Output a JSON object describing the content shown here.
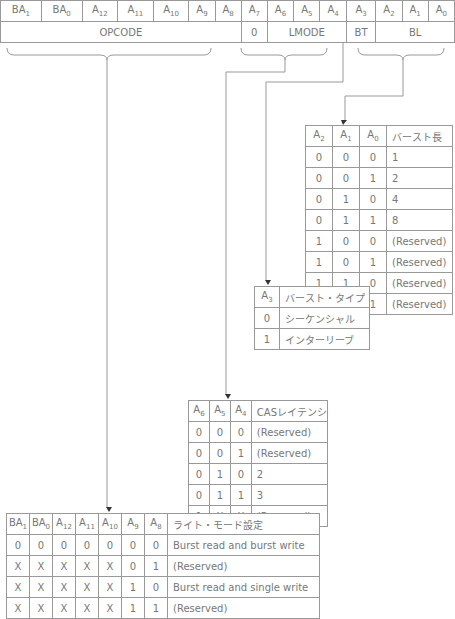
{
  "register": {
    "bits": [
      "BA1",
      "BA0",
      "A12",
      "A11",
      "A10",
      "A9",
      "A8",
      "A7",
      "A6",
      "A5",
      "A4",
      "A3",
      "A2",
      "A1",
      "A0"
    ],
    "fields": [
      {
        "label": "OPCODE",
        "span": 7
      },
      {
        "label": "0",
        "span": 1
      },
      {
        "label": "LMODE",
        "span": 3
      },
      {
        "label": "BT",
        "span": 1
      },
      {
        "label": "BL",
        "span": 3
      }
    ]
  },
  "burst_length_table": {
    "headers": [
      "A2",
      "A1",
      "A0",
      "バースト長"
    ],
    "rows": [
      [
        "0",
        "0",
        "0",
        "1"
      ],
      [
        "0",
        "0",
        "1",
        "2"
      ],
      [
        "0",
        "1",
        "0",
        "4"
      ],
      [
        "0",
        "1",
        "1",
        "8"
      ],
      [
        "1",
        "0",
        "0",
        "(Reserved)"
      ],
      [
        "1",
        "0",
        "1",
        "(Reserved)"
      ],
      [
        "1",
        "1",
        "0",
        "(Reserved)"
      ],
      [
        "1",
        "1",
        "1",
        "(Reserved)"
      ]
    ]
  },
  "burst_type_table": {
    "headers": [
      "A3",
      "バースト・タイプ"
    ],
    "rows": [
      [
        "0",
        "シーケンシャル"
      ],
      [
        "1",
        "インターリーブ"
      ]
    ]
  },
  "cas_latency_table": {
    "headers": [
      "A6",
      "A5",
      "A4",
      "CASレイテンシ"
    ],
    "rows": [
      [
        "0",
        "0",
        "0",
        "(Reserved)"
      ],
      [
        "0",
        "0",
        "1",
        "(Reserved)"
      ],
      [
        "0",
        "1",
        "0",
        "2"
      ],
      [
        "0",
        "1",
        "1",
        "3"
      ],
      [
        "1",
        "X",
        "X",
        "(Reserved)"
      ]
    ]
  },
  "write_mode_table": {
    "headers": [
      "BA1",
      "BA0",
      "A12",
      "A11",
      "A10",
      "A9",
      "A8",
      "ライト・モード設定"
    ],
    "rows": [
      [
        "0",
        "0",
        "0",
        "0",
        "0",
        "0",
        "0",
        "Burst read and burst write"
      ],
      [
        "X",
        "X",
        "X",
        "X",
        "X",
        "0",
        "1",
        "(Reserved)"
      ],
      [
        "X",
        "X",
        "X",
        "X",
        "X",
        "1",
        "0",
        "Burst read and single write"
      ],
      [
        "X",
        "X",
        "X",
        "X",
        "X",
        "1",
        "1",
        "(Reserved)"
      ]
    ]
  }
}
